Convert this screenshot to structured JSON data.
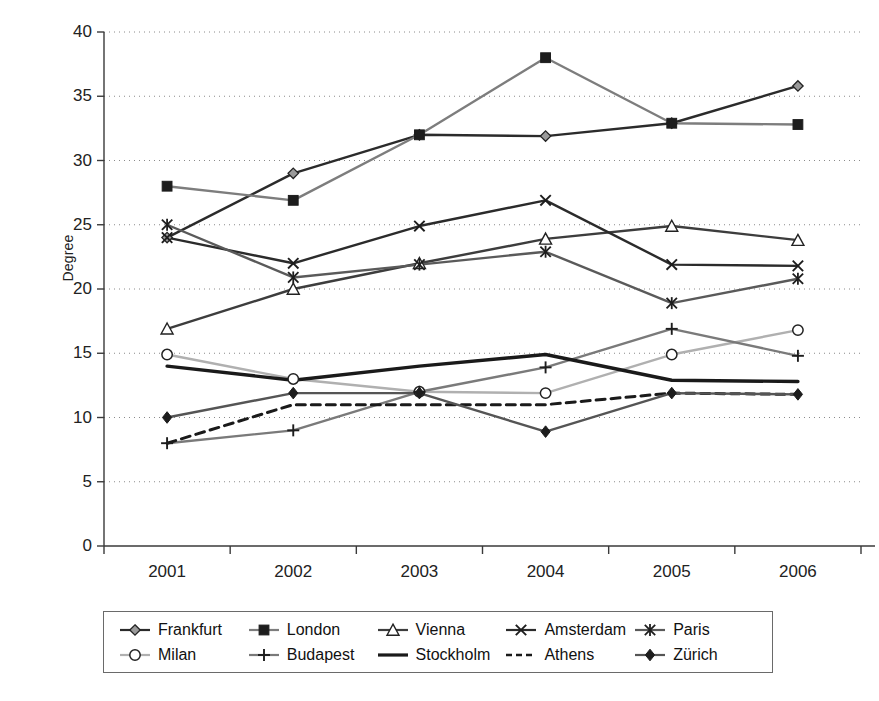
{
  "chart_data": {
    "type": "line",
    "title": "",
    "xlabel": "",
    "ylabel": "Degree",
    "categories": [
      "2001",
      "2002",
      "2003",
      "2004",
      "2005",
      "2006"
    ],
    "ylim": [
      0,
      40
    ],
    "ytick_values": [
      0,
      5,
      10,
      15,
      20,
      25,
      30,
      35,
      40
    ],
    "ytick_labels": [
      "0",
      "5",
      "10",
      "15",
      "20",
      "25",
      "30",
      "35",
      "40"
    ],
    "grid": "horizontal-dotted",
    "legend_position": "bottom",
    "series": [
      {
        "name": "Frankfurt",
        "marker": "open-diamond",
        "line": "solid",
        "color": "#2b2b2b",
        "values": [
          24.0,
          29.0,
          32.0,
          31.9,
          32.9,
          35.8
        ]
      },
      {
        "name": "London",
        "marker": "filled-square",
        "line": "solid",
        "color": "#7d7d7d",
        "values": [
          28.0,
          26.9,
          32.0,
          38.0,
          32.9,
          32.8
        ]
      },
      {
        "name": "Vienna",
        "marker": "open-triangle",
        "line": "solid",
        "color": "#3d3d3d",
        "values": [
          16.9,
          20.0,
          22.0,
          23.9,
          24.9,
          23.8
        ]
      },
      {
        "name": "Amsterdam",
        "marker": "x-cross",
        "line": "solid",
        "color": "#2b2b2b",
        "values": [
          24.0,
          22.0,
          24.9,
          26.9,
          21.9,
          21.8
        ]
      },
      {
        "name": "Paris",
        "marker": "asterisk",
        "line": "solid",
        "color": "#5a5a5a",
        "values": [
          25.0,
          20.9,
          21.9,
          22.9,
          18.9,
          20.8
        ]
      },
      {
        "name": "Milan",
        "marker": "open-circle",
        "line": "solid",
        "color": "#b0b0b0",
        "values": [
          14.9,
          13.0,
          12.0,
          11.9,
          14.9,
          16.8
        ]
      },
      {
        "name": "Budapest",
        "marker": "plus",
        "line": "solid",
        "color": "#7a7a7a",
        "values": [
          8.0,
          9.0,
          12.0,
          13.9,
          16.9,
          14.8
        ]
      },
      {
        "name": "Stockholm",
        "marker": "none",
        "line": "solid-thick",
        "color": "#1a1a1a",
        "values": [
          14.0,
          12.9,
          14.0,
          14.9,
          12.9,
          12.8
        ]
      },
      {
        "name": "Athens",
        "marker": "none",
        "line": "dashed",
        "color": "#1a1a1a",
        "values": [
          8.0,
          11.0,
          11.0,
          11.0,
          11.9,
          11.8
        ]
      },
      {
        "name": "Zürich",
        "marker": "filled-diamond",
        "line": "solid",
        "color": "#555555",
        "values": [
          10.0,
          11.9,
          11.9,
          8.9,
          11.9,
          11.8
        ]
      }
    ]
  },
  "axis": {
    "y_title": "Degree"
  },
  "legend": {
    "items": [
      {
        "label": "Frankfurt"
      },
      {
        "label": "London"
      },
      {
        "label": "Vienna"
      },
      {
        "label": "Amsterdam"
      },
      {
        "label": "Paris"
      },
      {
        "label": "Milan"
      },
      {
        "label": "Budapest"
      },
      {
        "label": "Stockholm"
      },
      {
        "label": "Athens"
      },
      {
        "label": "Zürich"
      }
    ]
  }
}
